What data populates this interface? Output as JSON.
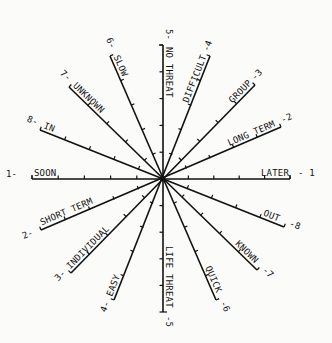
{
  "diagram": {
    "type": "semantic-differential-star",
    "center": [
      163,
      179
    ],
    "axes": [
      {
        "id": "1",
        "pos": "LATER",
        "neg": "SOON",
        "pos_num": "- 1",
        "neg_num": "1-"
      },
      {
        "id": "2",
        "pos": "LONG TERM",
        "neg": "SHORT TERM",
        "pos_num": "-2",
        "neg_num": "2-"
      },
      {
        "id": "3",
        "pos": "GROUP",
        "neg": "INDIVIDUAL",
        "pos_num": "-3",
        "neg_num": "3-"
      },
      {
        "id": "4",
        "pos": "DIFFICULT",
        "neg": "EASY",
        "pos_num": "-4",
        "neg_num": "4-"
      },
      {
        "id": "5",
        "pos": "NO THREAT",
        "neg": "LIFE THREAT",
        "pos_num": "5-",
        "neg_num": "-5"
      },
      {
        "id": "6",
        "pos": "SLOW",
        "neg": "QUICK",
        "pos_num": "6-",
        "neg_num": "-6"
      },
      {
        "id": "7",
        "pos": "UNKNOWN",
        "neg": "KNOWN",
        "pos_num": "7-",
        "neg_num": "-7"
      },
      {
        "id": "8",
        "pos": "IN",
        "neg": "OUT",
        "pos_num": "8-",
        "neg_num": "-8"
      }
    ]
  },
  "labels": {
    "later": "LATER",
    "later_num": "- 1",
    "soon": "SOON",
    "soon_num": "1-",
    "long_term": "LONG TERM",
    "long_term_num": "-2",
    "short_term": "SHORT TERM",
    "short_term_num": "2-",
    "group": "GROUP",
    "group_num": "-3",
    "individual": "INDIVIDUAL",
    "individual_num": "3-",
    "difficult": "DIFFICULT",
    "difficult_num": "-4",
    "easy": "EASY",
    "easy_num": "4-",
    "no_threat": "NO THREAT",
    "no_threat_num": "5-",
    "life_threat": "LIFE THREAT",
    "life_threat_num": "-5",
    "slow": "SLOW",
    "slow_num": "6-",
    "quick": "QUICK",
    "quick_num": "-6",
    "unknown": "UNKNOWN",
    "unknown_num": "7-",
    "known": "KNOWN",
    "known_num": "-7",
    "in": "IN",
    "in_num": "8-",
    "out": "OUT",
    "out_num": "-8"
  }
}
